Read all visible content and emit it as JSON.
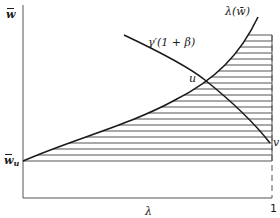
{
  "diagram": {
    "y_axis_label": "w",
    "y_axis_label_accent": "bar",
    "x_axis_label": "λ",
    "x_axis_end_tick": "1",
    "y_intercept_label": "w",
    "y_intercept_subscript": "u",
    "curve_upward_label": "λ(w̄)",
    "curve_downward_label": "γ′(1 + β)",
    "intersection_label": "u",
    "right_end_label": "v",
    "colors": {
      "line": "#1a1a1a",
      "hatch": "#555555",
      "axis": "#555555",
      "background": "#ffffff"
    },
    "hatch": {
      "y_top": 35,
      "y_bottom": 161,
      "spacing": 6,
      "x_right": 272
    }
  }
}
